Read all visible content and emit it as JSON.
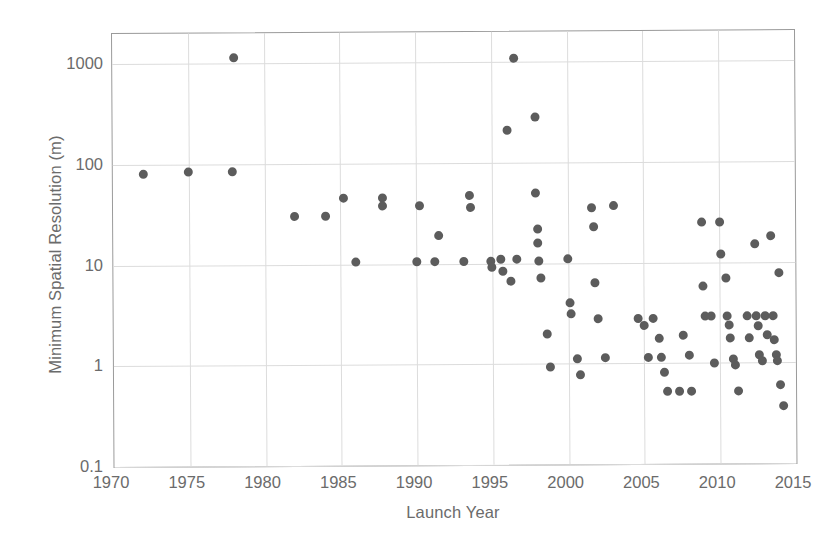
{
  "chart_data": {
    "type": "scatter",
    "title": "",
    "xlabel": "Launch Year",
    "ylabel": "Minimum Spatial Resolution (m)",
    "xlim": [
      1970,
      2015
    ],
    "ylim": [
      0.1,
      2000
    ],
    "yscale": "log",
    "xticks": [
      1970,
      1975,
      1980,
      1985,
      1990,
      1995,
      2000,
      2005,
      2010,
      2015
    ],
    "yticks": [
      0.1,
      1,
      10,
      100,
      1000
    ],
    "ytick_labels": [
      "0.1",
      "1",
      "10",
      "100",
      "1000"
    ],
    "grid": true,
    "legend": null,
    "marker_color": "#5c5c5c",
    "marker_size": 9,
    "points": [
      {
        "x": 1972.0,
        "y": 80
      },
      {
        "x": 1975.0,
        "y": 85
      },
      {
        "x": 1977.9,
        "y": 85
      },
      {
        "x": 1978.0,
        "y": 1150
      },
      {
        "x": 1982.0,
        "y": 30
      },
      {
        "x": 1984.0,
        "y": 30
      },
      {
        "x": 1985.2,
        "y": 45
      },
      {
        "x": 1986.0,
        "y": 10.5
      },
      {
        "x": 1987.8,
        "y": 45
      },
      {
        "x": 1987.8,
        "y": 38
      },
      {
        "x": 1990.0,
        "y": 10.5
      },
      {
        "x": 1990.2,
        "y": 38
      },
      {
        "x": 1991.2,
        "y": 10.5
      },
      {
        "x": 1991.5,
        "y": 19
      },
      {
        "x": 1993.1,
        "y": 10.5
      },
      {
        "x": 1993.5,
        "y": 48
      },
      {
        "x": 1993.6,
        "y": 36
      },
      {
        "x": 1994.9,
        "y": 10.5
      },
      {
        "x": 1995.0,
        "y": 9.2
      },
      {
        "x": 1995.6,
        "y": 11
      },
      {
        "x": 1995.7,
        "y": 8.4
      },
      {
        "x": 1996.2,
        "y": 6.7
      },
      {
        "x": 1996.0,
        "y": 210
      },
      {
        "x": 1996.5,
        "y": 1100
      },
      {
        "x": 1996.6,
        "y": 11
      },
      {
        "x": 1997.9,
        "y": 280
      },
      {
        "x": 1997.9,
        "y": 50
      },
      {
        "x": 1998.0,
        "y": 22
      },
      {
        "x": 1998.0,
        "y": 16
      },
      {
        "x": 1998.1,
        "y": 10.5
      },
      {
        "x": 1998.2,
        "y": 7.2
      },
      {
        "x": 1998.6,
        "y": 2.0
      },
      {
        "x": 1998.8,
        "y": 0.92
      },
      {
        "x": 2000.0,
        "y": 11
      },
      {
        "x": 2000.1,
        "y": 4.0
      },
      {
        "x": 2000.2,
        "y": 3.1
      },
      {
        "x": 2000.6,
        "y": 1.12
      },
      {
        "x": 2000.8,
        "y": 0.78
      },
      {
        "x": 2001.6,
        "y": 35
      },
      {
        "x": 2001.7,
        "y": 23
      },
      {
        "x": 2001.8,
        "y": 6.4
      },
      {
        "x": 2002.0,
        "y": 2.8
      },
      {
        "x": 2002.4,
        "y": 1.15
      },
      {
        "x": 2003.0,
        "y": 37
      },
      {
        "x": 2004.6,
        "y": 2.8
      },
      {
        "x": 2005.0,
        "y": 2.4
      },
      {
        "x": 2005.3,
        "y": 1.15
      },
      {
        "x": 2005.6,
        "y": 2.8
      },
      {
        "x": 2006.0,
        "y": 1.75
      },
      {
        "x": 2006.1,
        "y": 1.15
      },
      {
        "x": 2006.3,
        "y": 0.82
      },
      {
        "x": 2006.5,
        "y": 0.53
      },
      {
        "x": 2007.3,
        "y": 0.53
      },
      {
        "x": 2007.6,
        "y": 1.9
      },
      {
        "x": 2008.0,
        "y": 1.2
      },
      {
        "x": 2008.1,
        "y": 0.53
      },
      {
        "x": 2008.8,
        "y": 25
      },
      {
        "x": 2008.9,
        "y": 5.8
      },
      {
        "x": 2009.0,
        "y": 2.9
      },
      {
        "x": 2009.4,
        "y": 2.9
      },
      {
        "x": 2009.6,
        "y": 1.0
      },
      {
        "x": 2010.0,
        "y": 25
      },
      {
        "x": 2010.1,
        "y": 12
      },
      {
        "x": 2010.4,
        "y": 6.9
      },
      {
        "x": 2010.5,
        "y": 2.9
      },
      {
        "x": 2010.6,
        "y": 2.4
      },
      {
        "x": 2010.7,
        "y": 1.75
      },
      {
        "x": 2010.9,
        "y": 1.1
      },
      {
        "x": 2011.0,
        "y": 0.95
      },
      {
        "x": 2011.2,
        "y": 0.53
      },
      {
        "x": 2011.8,
        "y": 2.9
      },
      {
        "x": 2011.9,
        "y": 1.75
      },
      {
        "x": 2012.3,
        "y": 15
      },
      {
        "x": 2012.4,
        "y": 2.9
      },
      {
        "x": 2012.5,
        "y": 2.3
      },
      {
        "x": 2012.6,
        "y": 1.2
      },
      {
        "x": 2012.8,
        "y": 1.05
      },
      {
        "x": 2013.0,
        "y": 2.9
      },
      {
        "x": 2013.1,
        "y": 1.9
      },
      {
        "x": 2013.4,
        "y": 18
      },
      {
        "x": 2013.5,
        "y": 2.9
      },
      {
        "x": 2013.6,
        "y": 1.7
      },
      {
        "x": 2013.7,
        "y": 1.2
      },
      {
        "x": 2013.8,
        "y": 1.05
      },
      {
        "x": 2013.9,
        "y": 7.8
      },
      {
        "x": 2014.0,
        "y": 0.6
      },
      {
        "x": 2014.2,
        "y": 0.37
      }
    ]
  }
}
